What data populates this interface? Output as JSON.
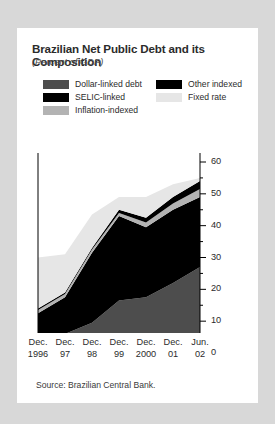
{
  "figure": {
    "title": "Brazilian Net Public Debt and its Composition",
    "subtitle": "(Percent of GDP)",
    "source": "Source: Brazilian Central Bank."
  },
  "colors": {
    "dollar_linked": "#4d4d4d",
    "selic_linked": "#000000",
    "other_indexed": "#000000",
    "inflation_indexed": "#b3b3b3",
    "fixed_rate": "#e6e6e6",
    "axis": "#000000",
    "card_background": "#ffffff",
    "page_background": "#d8d8d8",
    "text": "#2b2b2b"
  },
  "legend": {
    "position": "top",
    "entries": [
      {
        "label": "Dollar-linked debt",
        "color": "#4d4d4d",
        "column": 0,
        "row": 0
      },
      {
        "label": "SELIC-linked",
        "color": "#000000",
        "column": 0,
        "row": 1
      },
      {
        "label": "Inflation-indexed",
        "color": "#b3b3b3",
        "column": 0,
        "row": 2
      },
      {
        "label": "Other indexed",
        "color": "#000000",
        "column": 1,
        "row": 0
      },
      {
        "label": "Fixed rate",
        "color": "#e6e6e6",
        "column": 1,
        "row": 1
      }
    ]
  },
  "chart_data": {
    "type": "area",
    "stacked": true,
    "title": "Brazilian Net Public Debt and its Composition",
    "subtitle": "(Percent of GDP)",
    "xlabel": "",
    "ylabel": "",
    "ylim": [
      0,
      60
    ],
    "yticks": [
      0,
      10,
      20,
      30,
      40,
      50,
      60
    ],
    "ytick_labels": [
      "0",
      "10",
      "20",
      "30",
      "40",
      "50",
      "60"
    ],
    "y_axis_side": "right",
    "grid": false,
    "categories": [
      "Dec. 1996",
      "Dec. 97",
      "Dec. 98",
      "Dec. 99",
      "Dec. 2000",
      "Dec. 01",
      "Jun. 02"
    ],
    "x_tick_lines": [
      "Dec.|1996",
      "Dec.|97",
      "Dec.|98",
      "Dec.|99",
      "Dec.|2000",
      "Dec.|01",
      "Jun.|02"
    ],
    "series": [
      {
        "name": "Dollar-linked debt",
        "color": "#4d4d4d",
        "values": [
          4.5,
          6.0,
          9.5,
          16.5,
          17.5,
          22.0,
          27.0
        ]
      },
      {
        "name": "SELIC-linked",
        "color": "#000000",
        "values": [
          8.0,
          11.5,
          22.0,
          26.5,
          22.0,
          23.0,
          22.0
        ]
      },
      {
        "name": "Inflation-indexed",
        "color": "#b3b3b3",
        "values": [
          1.0,
          1.0,
          1.0,
          1.0,
          1.5,
          2.0,
          2.5
        ]
      },
      {
        "name": "Other indexed",
        "color": "#000000",
        "values": [
          0.5,
          0.5,
          0.5,
          1.0,
          1.5,
          2.0,
          2.5
        ]
      },
      {
        "name": "Fixed rate",
        "color": "#e6e6e6",
        "values": [
          16.0,
          12.0,
          10.5,
          4.0,
          6.5,
          4.0,
          1.0
        ]
      }
    ],
    "totals": [
      30.0,
      31.0,
      43.5,
      49.0,
      49.0,
      53.0,
      55.0
    ],
    "annotations": []
  },
  "axes": {
    "y_ticks_minor": true,
    "tick_color": "#000000"
  }
}
